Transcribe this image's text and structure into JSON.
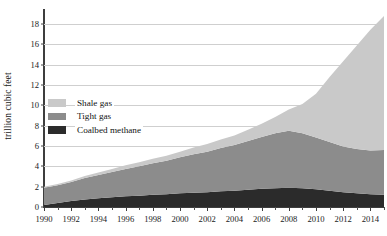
{
  "chart_data": {
    "type": "area",
    "title": "",
    "subtitle": "",
    "xlabel": "",
    "ylabel": "trillion cubic feet",
    "stacked": true,
    "grid": true,
    "legend_position": "inside-left",
    "xlim": [
      1990,
      2015
    ],
    "ylim": [
      0,
      19
    ],
    "ytick_step": 2,
    "x": [
      1990,
      1991,
      1992,
      1993,
      1994,
      1995,
      1996,
      1997,
      1998,
      1999,
      2000,
      2001,
      2002,
      2003,
      2004,
      2005,
      2006,
      2007,
      2008,
      2009,
      2010,
      2011,
      2012,
      2013,
      2014,
      2015
    ],
    "xtick_labels": [
      "1990",
      "1992",
      "1994",
      "1996",
      "1998",
      "2000",
      "2002",
      "2004",
      "2006",
      "2008",
      "2010",
      "2012",
      "2014"
    ],
    "ytick_labels": [
      "0",
      "2",
      "4",
      "6",
      "8",
      "10",
      "12",
      "14",
      "16",
      "18"
    ],
    "series": [
      {
        "name": "Coalbed methane",
        "color": "#2b2b2b",
        "values": [
          0.2,
          0.4,
          0.6,
          0.75,
          0.85,
          0.95,
          1.05,
          1.1,
          1.2,
          1.25,
          1.35,
          1.4,
          1.45,
          1.55,
          1.6,
          1.7,
          1.8,
          1.85,
          1.9,
          1.85,
          1.75,
          1.6,
          1.45,
          1.35,
          1.25,
          1.2
        ]
      },
      {
        "name": "Tight gas",
        "color": "#8c8c8c",
        "values": [
          1.7,
          1.75,
          1.85,
          2.1,
          2.3,
          2.5,
          2.7,
          2.9,
          3.1,
          3.3,
          3.55,
          3.8,
          4.0,
          4.25,
          4.5,
          4.8,
          5.1,
          5.4,
          5.6,
          5.4,
          5.1,
          4.8,
          4.5,
          4.35,
          4.3,
          4.4
        ]
      },
      {
        "name": "Shale gas",
        "color": "#c9c9c9",
        "values": [
          0.1,
          0.12,
          0.15,
          0.2,
          0.25,
          0.3,
          0.35,
          0.4,
          0.45,
          0.5,
          0.55,
          0.65,
          0.75,
          0.85,
          0.95,
          1.1,
          1.3,
          1.6,
          2.1,
          2.9,
          4.3,
          6.4,
          8.4,
          10.2,
          11.9,
          13.2
        ]
      }
    ],
    "totals_note": {
      "start_total": "2.0",
      "peak_total": "18.8"
    }
  },
  "legend": {
    "items": [
      {
        "label": "Shale gas",
        "color": "#c9c9c9"
      },
      {
        "label": "Tight gas",
        "color": "#8c8c8c"
      },
      {
        "label": "Coalbed methane",
        "color": "#2b2b2b"
      }
    ]
  }
}
